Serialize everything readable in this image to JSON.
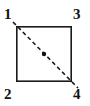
{
  "figure": {
    "type": "geometry-diagram",
    "background_color": "#ffffff",
    "stroke_color": "#1a1a1a",
    "label_color": "#121212"
  },
  "square": {
    "name": "square-outline",
    "x": 16,
    "y": 26,
    "width": 56,
    "height": 56,
    "stroke_width": 1.6,
    "fill": "none"
  },
  "diagonal": {
    "name": "dashed-diagonal",
    "from_label": "1",
    "to_label": "4",
    "x1": 13,
    "y1": 22,
    "x2": 78,
    "y2": 88,
    "style": "dashed",
    "dash_length": 4,
    "dash_gap": 3,
    "stroke_width": 1.6
  },
  "center_dot": {
    "name": "center-point-dot",
    "cx": 44,
    "cy": 54,
    "r": 2.2,
    "color": "#111111"
  },
  "labels": [
    {
      "id": "label-1",
      "text": "1",
      "corner": "top-left"
    },
    {
      "id": "label-3",
      "text": "3",
      "corner": "top-right"
    },
    {
      "id": "label-2",
      "text": "2",
      "corner": "bottom-left"
    },
    {
      "id": "label-4",
      "text": "4",
      "corner": "bottom-right"
    }
  ]
}
